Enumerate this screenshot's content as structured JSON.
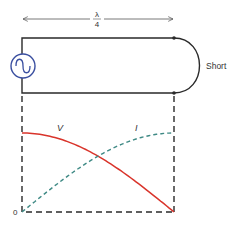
{
  "diagram": {
    "length_label_numerator": "λ",
    "length_label_denominator": "4",
    "termination_label": "Short",
    "source_icon": "ac-source-icon",
    "voltage_label": "V",
    "current_label": "I",
    "origin_label": "0",
    "colors": {
      "wire": "#2a2a2a",
      "source": "#3a4fa0",
      "voltage": "#d9342b",
      "current": "#3f8a85",
      "dashed": "#2a2a2a",
      "text": "#333333"
    },
    "curves": {
      "voltage": {
        "description": "Voltage maximum at source, falls to zero at the short",
        "start": 1.0,
        "end": 0.0
      },
      "current": {
        "description": "Current zero at source, rises to maximum at the short",
        "start": 0.0,
        "end": 1.0
      }
    }
  }
}
